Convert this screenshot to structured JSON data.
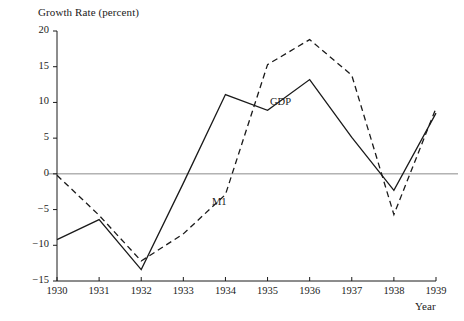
{
  "figure": {
    "y_axis_title": "Growth Rate (percent)",
    "x_axis_title": "Year",
    "series_labels": {
      "gdp": "GDP",
      "m1": "M1"
    },
    "y_tick_labels": [
      "20",
      "15",
      "10",
      "5",
      "0",
      "−5",
      "−10",
      "−15"
    ],
    "x_tick_labels": [
      "1930",
      "1931",
      "1932",
      "1933",
      "1934",
      "1935",
      "1936",
      "1937",
      "1938",
      "1939"
    ],
    "colors": {
      "line": "#1a1a1a",
      "axis": "#1a1a1a",
      "zero_line": "#8c8c8c",
      "background": "#ffffff"
    }
  },
  "chart_data": {
    "type": "line",
    "title": "",
    "xlabel": "Year",
    "ylabel": "Growth Rate (percent)",
    "x": [
      1930,
      1931,
      1932,
      1933,
      1934,
      1935,
      1936,
      1937,
      1938,
      1939
    ],
    "xlim": [
      1930,
      1939
    ],
    "ylim": [
      -15,
      20
    ],
    "yticks": [
      -15,
      -10,
      -5,
      0,
      5,
      10,
      15,
      20
    ],
    "ytick_labels": [
      "−15",
      "−10",
      "−5",
      "0",
      "5",
      "10",
      "15",
      "20"
    ],
    "grid": false,
    "legend": "inline-annotations",
    "zero_reference_line": 0,
    "series": [
      {
        "name": "GDP",
        "style": "solid",
        "color": "#1a1a1a",
        "values": [
          -9.2,
          -6.4,
          -13.4,
          -1.3,
          11.1,
          8.9,
          13.2,
          5.1,
          -2.3,
          8.5
        ]
      },
      {
        "name": "M1",
        "style": "dashed",
        "color": "#1a1a1a",
        "values": [
          -0.2,
          -5.8,
          -12.2,
          -8.4,
          -2.9,
          15.3,
          18.8,
          13.8,
          -5.7,
          9.2
        ]
      }
    ]
  }
}
